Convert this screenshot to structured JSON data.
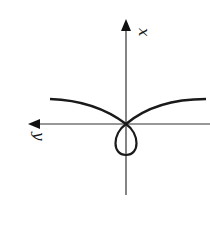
{
  "diagram": {
    "axes": {
      "vertical_label": "x",
      "horizontal_label": "y",
      "horizontal_direction": "left",
      "vertical_direction": "up"
    },
    "curve": {
      "description": "curve with two arms rising from origin and a closed loop below origin",
      "color": "#1a1a1a"
    },
    "colors": {
      "axis": "#333333",
      "curve": "#1a1a1a",
      "background": "#ffffff"
    }
  }
}
